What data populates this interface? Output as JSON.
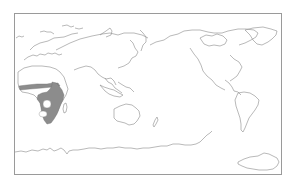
{
  "map": {
    "type": "world distribution map",
    "projection": "Pacific-centered equirectangular",
    "center_longitude": "~150E",
    "shaded_region": "Sub-Saharan Africa (Sahel band, East Africa, Southern Africa)",
    "colors": {
      "background": "#ffffff",
      "coastline": "#8a8a8a",
      "frame": "#9a9a9a",
      "range_fill": "#8c8c8c"
    }
  }
}
